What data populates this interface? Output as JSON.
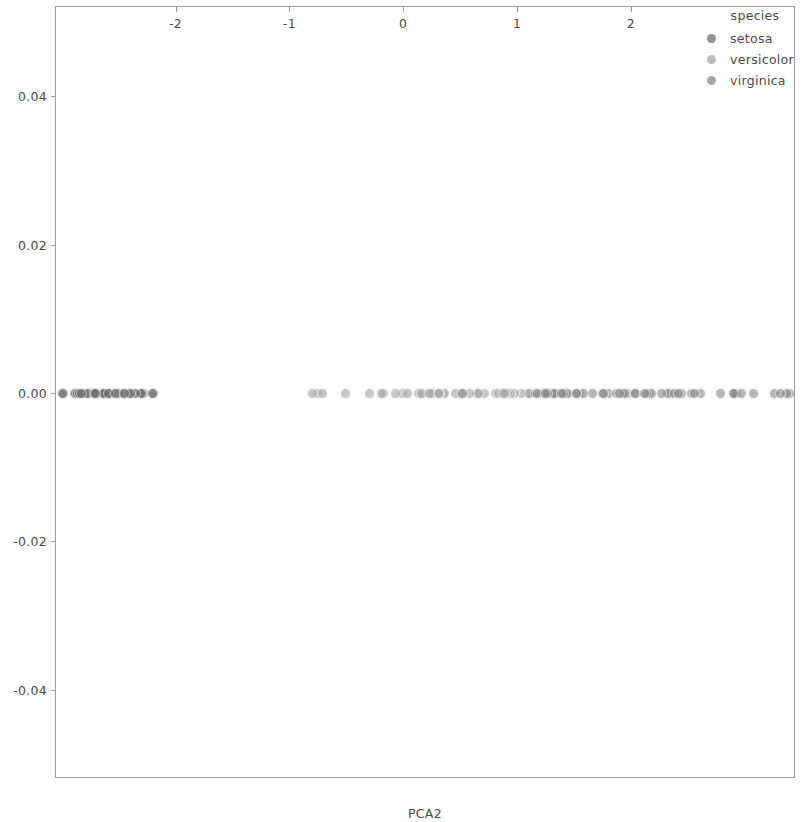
{
  "chart_data": {
    "type": "scatter",
    "title": "",
    "xlabel": "PCA2",
    "ylabel": "",
    "xlim": [
      -3.05,
      3.45
    ],
    "ylim": [
      -0.052,
      0.052
    ],
    "xticks": [
      -2,
      -1,
      0,
      1,
      2
    ],
    "xticklabels": [
      "-2",
      "-1",
      "0",
      "1",
      "2"
    ],
    "yticks": [
      0.04,
      0.02,
      0.0,
      -0.02,
      -0.04
    ],
    "yticklabels": [
      "0.04",
      "0.02",
      "0.00",
      "-0.02",
      "-0.04"
    ],
    "grid": false,
    "legend": {
      "title": "species",
      "position": "upper right",
      "entries": [
        {
          "label": "setosa",
          "color": "#6e6e6e"
        },
        {
          "label": "versicolor",
          "color": "#a8a8a8"
        },
        {
          "label": "virginica",
          "color": "#8a8a8a"
        }
      ]
    },
    "note": "All y values are exactly 0.00; points are jittered only along x (PCA2).",
    "series": [
      {
        "name": "setosa",
        "color": "#6e6e6e",
        "x": [
          -2.68,
          -2.71,
          -2.89,
          -2.75,
          -2.72,
          -2.28,
          -2.82,
          -2.62,
          -2.88,
          -2.67,
          -2.5,
          -2.61,
          -2.78,
          -3.22,
          -2.64,
          -2.38,
          -2.62,
          -2.64,
          -2.19,
          -2.58,
          -2.31,
          -2.54,
          -3.21,
          -2.3,
          -2.35,
          -2.5,
          -2.46,
          -2.56,
          -2.63,
          -2.63,
          -2.58,
          -2.41,
          -2.64,
          -2.59,
          -2.63,
          -2.86,
          -2.62,
          -2.8,
          -2.98,
          -2.59,
          -2.77,
          -2.84,
          -2.99,
          -2.4,
          -2.2,
          -2.71,
          -2.53,
          -2.83,
          -2.45,
          -2.7
        ],
        "y": [
          0,
          0,
          0,
          0,
          0,
          0,
          0,
          0,
          0,
          0,
          0,
          0,
          0,
          0,
          0,
          0,
          0,
          0,
          0,
          0,
          0,
          0,
          0,
          0,
          0,
          0,
          0,
          0,
          0,
          0,
          0,
          0,
          0,
          0,
          0,
          0,
          0,
          0,
          0,
          0,
          0,
          0,
          0,
          0,
          0,
          0,
          0,
          0,
          0,
          0
        ]
      },
      {
        "name": "versicolor",
        "color": "#a8a8a8",
        "x": [
          1.28,
          0.93,
          1.46,
          0.18,
          1.09,
          0.64,
          1.1,
          -0.75,
          1.04,
          -0.01,
          -0.51,
          0.51,
          0.26,
          0.98,
          -0.17,
          0.93,
          0.66,
          0.23,
          0.94,
          0.04,
          1.11,
          0.35,
          1.29,
          0.92,
          0.71,
          0.9,
          1.33,
          1.56,
          0.81,
          -0.3,
          -0.07,
          -0.19,
          0.13,
          1.28,
          0.66,
          0.84,
          1.22,
          0.87,
          0.26,
          0.16,
          0.46,
          0.89,
          0.23,
          -0.71,
          0.36,
          0.32,
          0.32,
          0.58,
          -0.8,
          0.31
        ],
        "y": [
          0,
          0,
          0,
          0,
          0,
          0,
          0,
          0,
          0,
          0,
          0,
          0,
          0,
          0,
          0,
          0,
          0,
          0,
          0,
          0,
          0,
          0,
          0,
          0,
          0,
          0,
          0,
          0,
          0,
          0,
          0,
          0,
          0,
          0,
          0,
          0,
          0,
          0,
          0,
          0,
          0,
          0,
          0,
          0,
          0,
          0,
          0,
          0,
          0,
          0
        ]
      },
      {
        "name": "virginica",
        "color": "#8a8a8a",
        "x": [
          2.53,
          1.41,
          2.61,
          1.97,
          2.35,
          3.39,
          0.52,
          2.93,
          2.32,
          2.91,
          1.66,
          1.8,
          2.16,
          1.34,
          1.58,
          1.87,
          1.52,
          3.37,
          3.26,
          1.24,
          2.18,
          1.16,
          3.08,
          1.44,
          2.27,
          2.79,
          1.32,
          1.27,
          2.03,
          2.44,
          2.97,
          3.31,
          2.04,
          1.18,
          1.43,
          2.9,
          2.14,
          1.75,
          1.25,
          2.12,
          2.38,
          1.93,
          1.41,
          2.56,
          2.42,
          1.94,
          1.52,
          1.76,
          1.9,
          1.39
        ],
        "y": [
          0,
          0,
          0,
          0,
          0,
          0,
          0,
          0,
          0,
          0,
          0,
          0,
          0,
          0,
          0,
          0,
          0,
          0,
          0,
          0,
          0,
          0,
          0,
          0,
          0,
          0,
          0,
          0,
          0,
          0,
          0,
          0,
          0,
          0,
          0,
          0,
          0,
          0,
          0,
          0,
          0,
          0,
          0,
          0,
          0,
          0,
          0,
          0,
          0,
          0
        ]
      }
    ]
  },
  "legend": {
    "title": "species",
    "items": [
      {
        "label": "setosa"
      },
      {
        "label": "versicolor"
      },
      {
        "label": "virginica"
      }
    ]
  },
  "axis": {
    "xlabel": "PCA2",
    "xticklabels": [
      "-2",
      "-1",
      "0",
      "1",
      "2"
    ],
    "yticklabels": [
      "0.04",
      "0.02",
      "0.00",
      "-0.02",
      "-0.04"
    ]
  }
}
